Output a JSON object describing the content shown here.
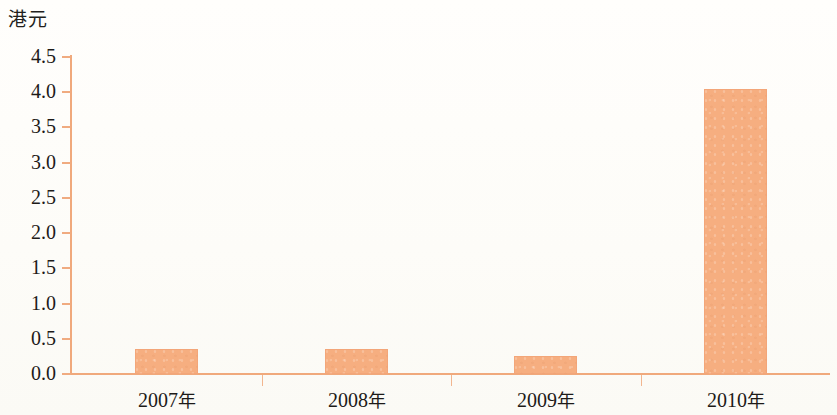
{
  "chart": {
    "y_unit_label": "港元",
    "background_color": "#fdfcf8",
    "bar_color": "#f6ae80",
    "axis_color": "#f0a97c",
    "text_color": "#1d1a18"
  },
  "chart_data": {
    "type": "bar",
    "title": "",
    "subtitle": "",
    "xlabel": "",
    "ylabel": "港元",
    "categories": [
      "2007年",
      "2008年",
      "2009年",
      "2010年"
    ],
    "values": [
      0.35,
      0.35,
      0.26,
      4.05
    ],
    "series": [
      {
        "name": "港元",
        "values": [
          0.35,
          0.35,
          0.26,
          4.05
        ]
      }
    ],
    "ylim": [
      0.0,
      4.5
    ],
    "ytick_labels": [
      "0.0",
      "0.5",
      "1.0",
      "1.5",
      "2.0",
      "2.5",
      "3.0",
      "3.5",
      "4.0",
      "4.5"
    ],
    "ytick_values": [
      0.0,
      0.5,
      1.0,
      1.5,
      2.0,
      2.5,
      3.0,
      3.5,
      4.0,
      4.5
    ],
    "grid": false,
    "legend": false,
    "legend_position": "none",
    "annotations": []
  }
}
